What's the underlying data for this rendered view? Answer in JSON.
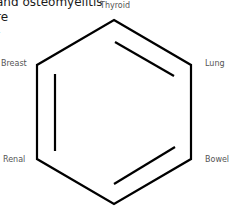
{
  "partial_text": {
    "lines": [
      "and osteomyelitis",
      "re",
      "-"
    ]
  },
  "diagram": {
    "type": "benzene-ring-hexagon",
    "stroke_color": "#000000",
    "labels": {
      "top": "Thyroid",
      "upper_left": "Breast",
      "upper_right": "Lung",
      "lower_left": "Renal",
      "lower_right": "Bowel"
    },
    "vertices": {
      "top": [
        114,
        20
      ],
      "upper_right": [
        191,
        65
      ],
      "lower_right": [
        191,
        159
      ],
      "bottom": [
        114,
        204
      ],
      "lower_left": [
        37,
        159
      ],
      "upper_left": [
        37,
        65
      ]
    },
    "inner_double_bonds": [
      {
        "edge": "top-upper_right",
        "from": [
          115,
          42
        ],
        "to": [
          174,
          76
        ]
      },
      {
        "edge": "lower_right-bottom",
        "from": [
          175,
          147
        ],
        "to": [
          114,
          184
        ]
      },
      {
        "edge": "lower_left-upper_left",
        "from": [
          55,
          74
        ],
        "to": [
          55,
          151
        ]
      }
    ]
  }
}
